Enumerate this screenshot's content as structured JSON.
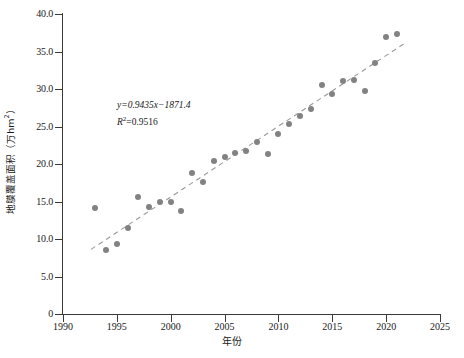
{
  "chart_data": {
    "type": "scatter",
    "title": "",
    "xlabel": "年份",
    "ylabel": "地膜覆盖面积（万hm²）",
    "xlim": [
      1990,
      2025
    ],
    "ylim": [
      0,
      40
    ],
    "xticks": [
      1990,
      1995,
      2000,
      2005,
      2010,
      2015,
      2020,
      2025
    ],
    "xticklabels": [
      "1990",
      "1995",
      "2000",
      "2005",
      "2010",
      "2015",
      "2020",
      "2025"
    ],
    "yticks": [
      0,
      5,
      10,
      15,
      20,
      25,
      30,
      35,
      40
    ],
    "yticklabels": [
      "0",
      "5.0",
      "10.0",
      "15.0",
      "20.0",
      "25.0",
      "30.0",
      "35.0",
      "40.0"
    ],
    "grid": false,
    "legend": null,
    "marker_color": "#828282",
    "trendline_color": "#9a9a9a",
    "trendline_style": "dashed",
    "annotations": {
      "equation": "y=0.9435x−1871.4",
      "r_squared_label": "R",
      "r_squared_sup": "2",
      "r_squared_value": "=0.9516"
    },
    "trendline": {
      "slope": 0.9435,
      "intercept": -1871.4,
      "r2": 0.9516,
      "x_start": 1992.6,
      "x_end": 2021.8
    },
    "x": [
      1993,
      1994,
      1995,
      1996,
      1997,
      1998,
      1999,
      2000,
      2001,
      2002,
      2003,
      2004,
      2005,
      2006,
      2007,
      2008,
      2009,
      2010,
      2011,
      2012,
      2013,
      2014,
      2015,
      2016,
      2017,
      2018,
      2019,
      2020,
      2021
    ],
    "values": [
      14.1,
      8.6,
      9.3,
      11.5,
      15.6,
      14.3,
      14.9,
      15.0,
      13.8,
      18.8,
      17.6,
      20.4,
      20.9,
      21.5,
      21.8,
      22.9,
      21.3,
      24.0,
      25.4,
      26.4,
      27.3,
      30.6,
      29.3,
      31.1,
      31.2,
      29.7,
      33.5,
      37.0,
      37.4
    ]
  }
}
